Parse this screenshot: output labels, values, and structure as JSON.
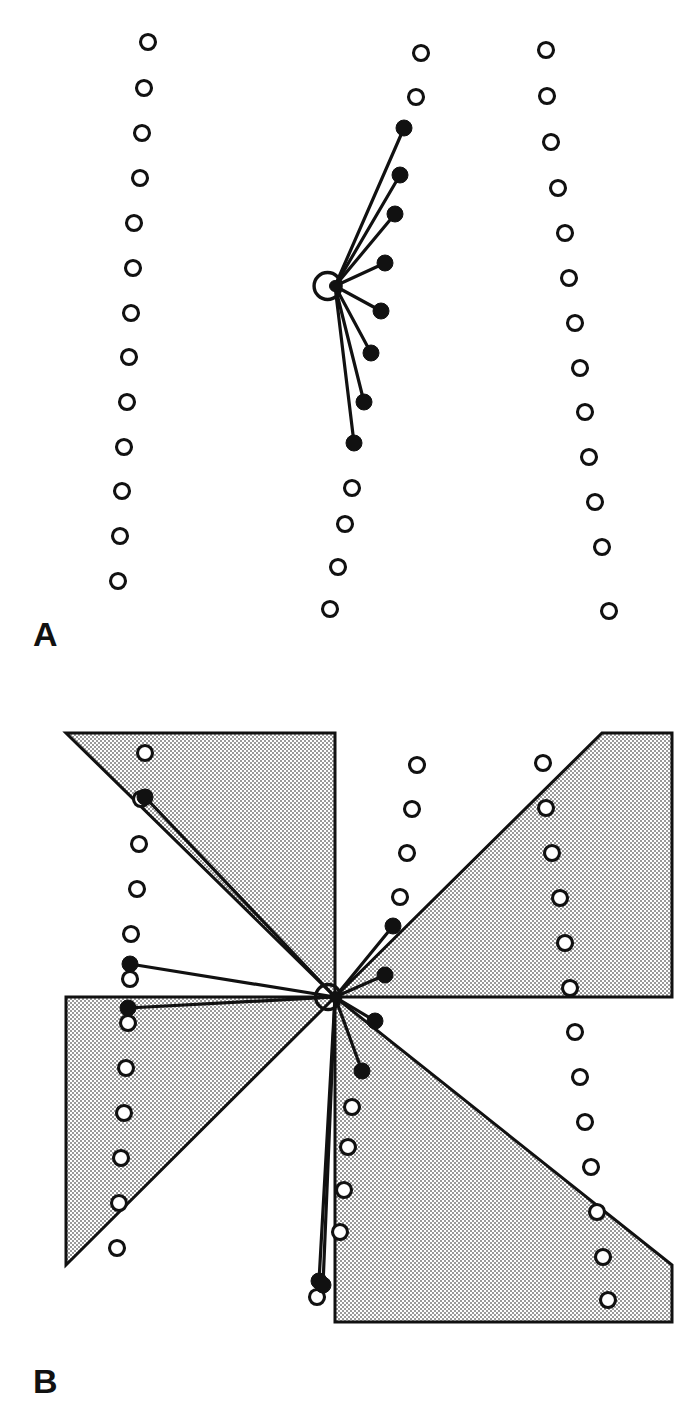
{
  "figure": {
    "background_color": "#ffffff",
    "ink_color": "#111111",
    "shade_fill_color": "#c9c9c9",
    "width": 692,
    "height": 1407,
    "panels": [
      {
        "id": "A",
        "letter": "A",
        "letter_x": 33,
        "letter_y": 646,
        "description": "Three vertical arcs of open circles with a central hub emitting eight rays to filled circles"
      },
      {
        "id": "B",
        "letter": "B",
        "letter_x": 33,
        "letter_y": 1393,
        "description": "Pinwheel of four shaded right triangles around a central hub with nine rays to filled circles, overlaid on three arcs of open circles"
      }
    ]
  },
  "chart_data": {
    "type": "scatter",
    "xlabel": "",
    "ylabel": "",
    "grid": false,
    "legend": null,
    "panels": [
      {
        "id": "A",
        "hub": {
          "x": 335,
          "y": 286,
          "ring_radius": 13.5,
          "core_radius": 5.5
        },
        "open_circle_radius": 7.5,
        "filled_circle_radius": 8.0,
        "arcs": [
          {
            "name": "left-arc",
            "points": [
              [
                148,
                42
              ],
              [
                144,
                88
              ],
              [
                142,
                133
              ],
              [
                140,
                178
              ],
              [
                134,
                223
              ],
              [
                133,
                268
              ],
              [
                131,
                313
              ],
              [
                129,
                357
              ],
              [
                127,
                402
              ],
              [
                124,
                447
              ],
              [
                122,
                491
              ],
              [
                120,
                536
              ],
              [
                118,
                581
              ]
            ]
          },
          {
            "name": "middle-arc",
            "points": [
              [
                421,
                53
              ],
              [
                416,
                97
              ],
              [
                352,
                488
              ],
              [
                345,
                524
              ],
              [
                338,
                567
              ],
              [
                330,
                609
              ]
            ]
          },
          {
            "name": "right-arc",
            "points": [
              [
                546,
                50
              ],
              [
                547,
                96
              ],
              [
                551,
                142
              ],
              [
                558,
                188
              ],
              [
                565,
                233
              ],
              [
                569,
                278
              ],
              [
                575,
                323
              ],
              [
                580,
                368
              ],
              [
                585,
                412
              ],
              [
                589,
                457
              ],
              [
                595,
                502
              ],
              [
                602,
                547
              ],
              [
                609,
                611
              ]
            ]
          }
        ],
        "rays": [
          {
            "angle_label": "ray-1",
            "end": [
              404,
              128
            ]
          },
          {
            "angle_label": "ray-2",
            "end": [
              400,
              175
            ]
          },
          {
            "angle_label": "ray-3",
            "end": [
              395,
              214
            ]
          },
          {
            "angle_label": "ray-4",
            "end": [
              385,
              263
            ]
          },
          {
            "angle_label": "ray-5",
            "end": [
              381,
              311
            ]
          },
          {
            "angle_label": "ray-6",
            "end": [
              371,
              353
            ]
          },
          {
            "angle_label": "ray-7",
            "end": [
              364,
              402
            ]
          },
          {
            "angle_label": "ray-8",
            "end": [
              354,
              443
            ]
          }
        ]
      },
      {
        "id": "B",
        "hub": {
          "x": 335,
          "y": 997,
          "ring_radius": 12.5,
          "core_radius": 5.5
        },
        "open_circle_radius": 7.5,
        "filled_circle_radius": 8.0,
        "bounds": {
          "left": 66,
          "top": 733,
          "right": 672,
          "bottom": 1322
        },
        "sectors": [
          {
            "name": "sector-top-left",
            "points": "66,733 335,733 335,997"
          },
          {
            "name": "sector-top-right",
            "points": "335,997 602,733 672,733 672,997"
          },
          {
            "name": "sector-bottom-left",
            "points": "66,997 335,997 66,1265"
          },
          {
            "name": "sector-bottom-right",
            "points": "335,997 335,1322 672,1322 672,1265"
          }
        ],
        "arcs": [
          {
            "name": "left-arc",
            "points": [
              [
                145,
                753
              ],
              [
                141,
                799
              ],
              [
                139,
                844
              ],
              [
                137,
                889
              ],
              [
                131,
                934
              ],
              [
                130,
                979
              ],
              [
                128,
                1023
              ],
              [
                126,
                1068
              ],
              [
                124,
                1113
              ],
              [
                121,
                1158
              ],
              [
                119,
                1203
              ],
              [
                117,
                1248
              ]
            ]
          },
          {
            "name": "middle-arc",
            "points": [
              [
                417,
                765
              ],
              [
                412,
                809
              ],
              [
                407,
                853
              ],
              [
                400,
                897
              ],
              [
                352,
                1107
              ],
              [
                348,
                1147
              ],
              [
                344,
                1190
              ],
              [
                340,
                1232
              ],
              [
                317,
                1297
              ]
            ]
          },
          {
            "name": "right-arc",
            "points": [
              [
                543,
                763
              ],
              [
                546,
                808
              ],
              [
                552,
                853
              ],
              [
                560,
                898
              ],
              [
                565,
                943
              ],
              [
                570,
                988
              ],
              [
                575,
                1032
              ],
              [
                580,
                1077
              ],
              [
                585,
                1122
              ],
              [
                591,
                1167
              ],
              [
                597,
                1212
              ],
              [
                603,
                1257
              ],
              [
                608,
                1300
              ]
            ]
          }
        ],
        "rays": [
          {
            "angle_label": "ray-1",
            "end": [
              145,
              797
            ]
          },
          {
            "angle_label": "ray-2",
            "end": [
              130,
              964
            ]
          },
          {
            "angle_label": "ray-3",
            "end": [
              128,
              1008
            ]
          },
          {
            "angle_label": "ray-4",
            "end": [
              393,
              926
            ]
          },
          {
            "angle_label": "ray-5",
            "end": [
              385,
              975
            ]
          },
          {
            "angle_label": "ray-6",
            "end": [
              375,
              1021
            ]
          },
          {
            "angle_label": "ray-7",
            "end": [
              362,
              1071
            ]
          },
          {
            "angle_label": "ray-8",
            "end": [
              319,
              1281
            ]
          },
          {
            "angle_label": "ray-9",
            "end": [
              323,
              1285
            ]
          }
        ]
      }
    ]
  }
}
